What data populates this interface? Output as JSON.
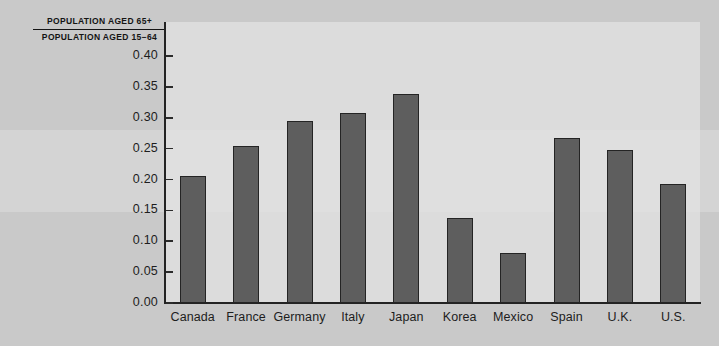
{
  "chart_data": {
    "type": "bar",
    "title_numerator": "POPULATION AGED 65+",
    "title_denominator": "POPULATION AGED 15−64",
    "xlabel": "",
    "ylabel": "",
    "ylim": [
      0.0,
      0.4
    ],
    "yticks": [
      "0.00",
      "0.05",
      "0.10",
      "0.15",
      "0.20",
      "0.25",
      "0.30",
      "0.35",
      "0.40"
    ],
    "ytick_values": [
      0.0,
      0.05,
      0.1,
      0.15,
      0.2,
      0.25,
      0.3,
      0.35,
      0.4
    ],
    "grid": false,
    "legend": "none",
    "categories": [
      "Canada",
      "France",
      "Germany",
      "Italy",
      "Japan",
      "Korea",
      "Mexico",
      "Spain",
      "U.K.",
      "U.S."
    ],
    "values": [
      0.205,
      0.254,
      0.294,
      0.308,
      0.339,
      0.138,
      0.081,
      0.267,
      0.248,
      0.193
    ],
    "bar_color": "#5e5e5e",
    "bar_edge_color": "#242424",
    "plot_background": "#dcdcdc",
    "figure_background": "#c9c9c9",
    "axis_color": "#232323",
    "text_color": "#1d1d1d"
  }
}
